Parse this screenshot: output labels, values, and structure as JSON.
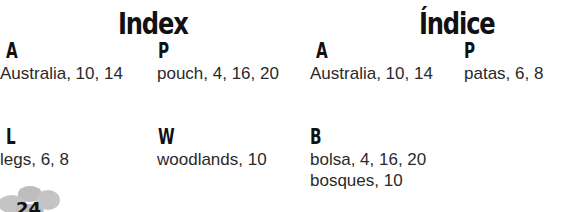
{
  "english": {
    "title": "Index",
    "sections": [
      {
        "letter": "A",
        "entries": [
          "Australia, 10, 14"
        ]
      },
      {
        "letter": "P",
        "entries": [
          "pouch, 4, 16, 20"
        ]
      },
      {
        "letter": "L",
        "entries": [
          "legs, 6, 8"
        ]
      },
      {
        "letter": "W",
        "entries": [
          "woodlands, 10"
        ]
      }
    ]
  },
  "spanish": {
    "title": "Índice",
    "sections": [
      {
        "letter": "A",
        "entries": [
          "Australia, 10, 14"
        ]
      },
      {
        "letter": "P",
        "entries": [
          "patas, 6, 8"
        ]
      },
      {
        "letter": "B",
        "entries": [
          "bolsa, 4, 16, 20",
          "bosques, 10"
        ]
      }
    ]
  },
  "page_number": "24",
  "colors": {
    "flower": "#bdbdbd",
    "text": "#2a2a2a",
    "heading": "#111111"
  }
}
